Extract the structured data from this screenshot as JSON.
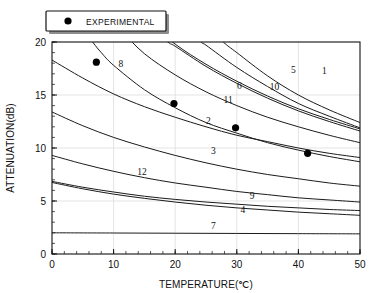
{
  "chart_data": {
    "type": "line",
    "title": "",
    "xlabel": "TEMPERATURE(℃)",
    "ylabel": "ATTENUATION(dB)",
    "xlim": [
      0,
      50
    ],
    "ylim": [
      0,
      20
    ],
    "xticks": [
      0,
      10,
      20,
      30,
      40,
      50
    ],
    "yticks": [
      0,
      5,
      10,
      15,
      20
    ],
    "xtick_labels": [
      "0",
      "10",
      "20",
      "30",
      "40",
      "50"
    ],
    "ytick_labels": [
      "0",
      "5",
      "10",
      "15",
      "20"
    ],
    "x_minor_interval": 2,
    "y_minor_interval": 1,
    "grid": true,
    "grid_color": "#d8d8d8",
    "line_color": "#1b1b1b",
    "marker_color": "#000000",
    "legend": {
      "position": "top-left-outside",
      "entries": [
        {
          "label": "EXPERIMENTAL",
          "marker": "filled-circle",
          "color": "#000000"
        }
      ]
    },
    "scatter_series": {
      "name": "EXPERIMENTAL",
      "marker": "filled-circle",
      "points": [
        {
          "x": 7.2,
          "y": 18.1
        },
        {
          "x": 19.8,
          "y": 14.2
        },
        {
          "x": 29.8,
          "y": 11.9
        },
        {
          "x": 41.5,
          "y": 9.5
        }
      ]
    },
    "series": [
      {
        "name": "1",
        "label": "1",
        "label_x": 44.2,
        "label_y": 17.0,
        "x": [
          0,
          5,
          10,
          15,
          20,
          25,
          27.8,
          30,
          35,
          40,
          45,
          50
        ],
        "y": [
          43.0,
          37.2,
          32.2,
          28.0,
          24.4,
          21.6,
          20.0,
          19.0,
          16.8,
          15.0,
          13.6,
          12.4
        ]
      },
      {
        "name": "2",
        "label": "2",
        "label_x": 25.4,
        "label_y": 12.3,
        "x": [
          0,
          5,
          10,
          15,
          20,
          25,
          30,
          35,
          40,
          45,
          50
        ],
        "y": [
          18.3,
          16.6,
          15.1,
          13.9,
          12.9,
          12.0,
          11.2,
          10.6,
          10.0,
          9.5,
          9.1
        ]
      },
      {
        "name": "3",
        "label": "3",
        "label_x": 26.2,
        "label_y": 9.4,
        "x": [
          0,
          5,
          10,
          15,
          20,
          25,
          30,
          35,
          40,
          45,
          50
        ],
        "y": [
          13.4,
          12.1,
          11.0,
          10.1,
          9.3,
          8.6,
          8.0,
          7.5,
          7.1,
          6.7,
          6.4
        ]
      },
      {
        "name": "4",
        "label": "4",
        "label_x": 31.0,
        "label_y": 3.9,
        "x": [
          0,
          5,
          10,
          15,
          20,
          25,
          30,
          35,
          40,
          45,
          50
        ],
        "y": [
          6.75,
          6.15,
          5.65,
          5.25,
          4.9,
          4.6,
          4.35,
          4.15,
          3.95,
          3.8,
          3.65
        ]
      },
      {
        "name": "5",
        "label": "5",
        "label_x": 39.2,
        "label_y": 17.1,
        "x": [
          0,
          5,
          10,
          15,
          20,
          24.2,
          25,
          30,
          35,
          40,
          45,
          50
        ],
        "y": [
          38.0,
          33.0,
          28.8,
          25.2,
          22.2,
          20.0,
          19.7,
          17.6,
          15.8,
          14.2,
          13.0,
          11.9
        ]
      },
      {
        "name": "6",
        "label": "6",
        "label_x": 30.4,
        "label_y": 15.6,
        "x": [
          0,
          5,
          10,
          15,
          18.8,
          20,
          25,
          30,
          35,
          40,
          45,
          50
        ],
        "y": [
          31.0,
          27.4,
          24.4,
          21.8,
          20.0,
          19.6,
          17.7,
          16.1,
          14.7,
          13.5,
          12.5,
          11.6
        ]
      },
      {
        "name": "7",
        "label": "7",
        "label_x": 26.2,
        "label_y": 2.35,
        "x": [
          0,
          10,
          20,
          30,
          40,
          50
        ],
        "y": [
          2.0,
          1.98,
          1.96,
          1.94,
          1.92,
          1.9
        ]
      },
      {
        "name": "8",
        "label": "8",
        "label_x": 11.2,
        "label_y": 17.6,
        "x": [
          0,
          2,
          4,
          6.6,
          8,
          10,
          15,
          20,
          25,
          30,
          35,
          40,
          45,
          50
        ],
        "y": [
          26.5,
          24.2,
          22.1,
          20.0,
          19.0,
          17.8,
          15.5,
          13.8,
          12.4,
          11.4,
          10.5,
          9.8,
          9.2,
          8.7
        ]
      },
      {
        "name": "9",
        "label": "9",
        "label_x": 32.5,
        "label_y": 5.2,
        "x": [
          0,
          5,
          10,
          15,
          20,
          25,
          30,
          35,
          40,
          45,
          50
        ],
        "y": [
          6.85,
          6.3,
          5.85,
          5.45,
          5.15,
          4.9,
          4.7,
          4.5,
          4.35,
          4.2,
          4.1
        ]
      },
      {
        "name": "10",
        "label": "10",
        "label_x": 36.1,
        "label_y": 15.5,
        "x": [
          0,
          5,
          10,
          13.0,
          15,
          20,
          25,
          30,
          35,
          40,
          45,
          50
        ],
        "y": [
          33.6,
          29.0,
          25.2,
          23.2,
          22.2,
          19.8,
          17.9,
          16.3,
          14.9,
          13.7,
          12.7,
          11.8
        ]
      },
      {
        "name": "11",
        "label": "11",
        "label_x": 28.6,
        "label_y": 14.2,
        "x": [
          0,
          3,
          6,
          9,
          11.4,
          15,
          20,
          25,
          30,
          35,
          40,
          45,
          50
        ],
        "y": [
          30.0,
          27.2,
          24.8,
          22.6,
          21.0,
          18.9,
          16.9,
          15.3,
          14.0,
          12.9,
          12.0,
          11.2,
          10.5
        ]
      },
      {
        "name": "12",
        "label": "12",
        "label_x": 14.6,
        "label_y": 7.5,
        "x": [
          0,
          5,
          10,
          15,
          20,
          25,
          30,
          35,
          40,
          45,
          50
        ],
        "y": [
          9.3,
          8.5,
          7.8,
          7.2,
          6.7,
          6.3,
          5.9,
          5.6,
          5.3,
          5.1,
          4.9
        ]
      }
    ]
  }
}
